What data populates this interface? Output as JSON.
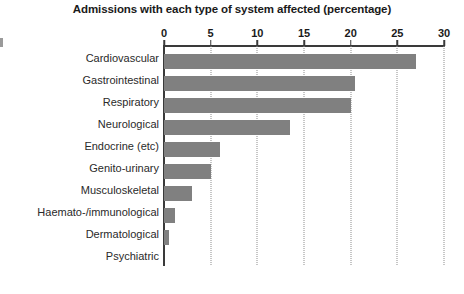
{
  "chart_data": {
    "type": "bar",
    "orientation": "horizontal",
    "title": "Admissions with each type of system affected (percentage)",
    "xlabel": "",
    "ylabel": "",
    "xlim": [
      0,
      30
    ],
    "xticks": [
      0,
      5,
      10,
      15,
      20,
      25,
      30
    ],
    "xtick_labels": [
      "0",
      "5",
      "10",
      "15",
      "20",
      "25",
      "30"
    ],
    "grid": "vertical-dotted",
    "legend": "none",
    "bar_color": "#808080",
    "axis_color": "#3a3a3a",
    "gridline_color": "#8c8c8c",
    "categories": [
      "Cardiovascular",
      "Gastrointestinal",
      "Respiratory",
      "Neurological",
      "Endocrine (etc)",
      "Genito-urinary",
      "Musculoskeletal",
      "Haemato-/immunological",
      "Dermatological",
      "Psychiatric"
    ],
    "values": [
      27,
      20.5,
      20,
      13.5,
      6,
      5,
      3,
      1.2,
      0.5,
      0
    ]
  }
}
